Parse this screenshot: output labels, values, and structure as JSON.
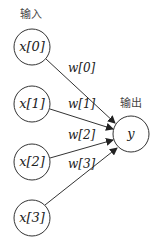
{
  "diagram": {
    "input_label": "输入",
    "output_label": "输出",
    "inputs": [
      "x[0]",
      "x[1]",
      "x[2]",
      "x[3]"
    ],
    "weights": [
      "w[0]",
      "w[1]",
      "w[2]",
      "w[3]"
    ],
    "output": "y"
  }
}
